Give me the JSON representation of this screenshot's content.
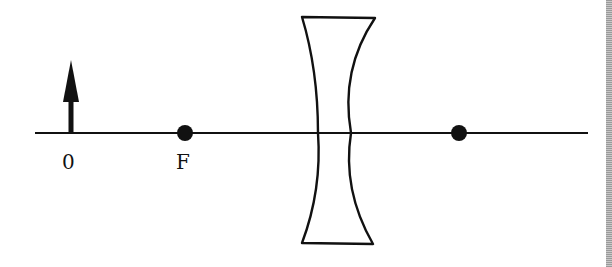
{
  "diagram": {
    "labels": {
      "object": "0",
      "focal_point": "F"
    },
    "elements": {
      "optical_axis": {
        "x1": 35,
        "x2": 588,
        "y": 133
      },
      "object_arrow": {
        "x": 71,
        "y_base": 133,
        "y_tip": 60
      },
      "focal_point_left": {
        "x": 185,
        "y": 133
      },
      "focal_point_right": {
        "x": 459,
        "y": 133
      },
      "lens": {
        "type": "concave",
        "top_y": 17,
        "bottom_y": 243,
        "left_x": 302,
        "right_x": 375,
        "waist_left_x": 317,
        "waist_right_x": 352
      }
    },
    "colors": {
      "stroke": "#111111",
      "background": "#ffffff"
    }
  }
}
